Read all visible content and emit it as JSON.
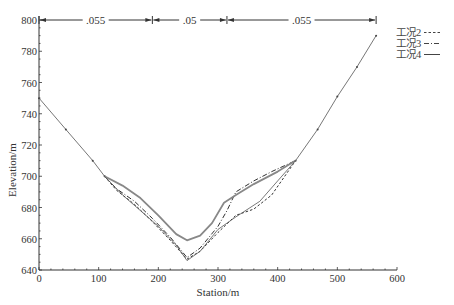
{
  "chart_data": {
    "type": "line",
    "title": "",
    "xlabel": "Station/m",
    "ylabel": "Elevation/m",
    "xlim": [
      0,
      600
    ],
    "ylim": [
      640,
      800
    ],
    "xticks": [
      0,
      100,
      200,
      300,
      400,
      500,
      600
    ],
    "yticks": [
      640,
      660,
      680,
      700,
      720,
      740,
      760,
      780,
      800
    ],
    "grid": false,
    "legend_position": "top-right",
    "roughness_regions": [
      {
        "label": ".055",
        "x_start": 0,
        "x_end": 190
      },
      {
        "label": ".05",
        "x_start": 190,
        "x_end": 315
      },
      {
        "label": ".055",
        "x_start": 315,
        "x_end": 565
      }
    ],
    "ground": {
      "name": "terrain",
      "x": [
        0,
        45,
        90,
        110
      ],
      "y": [
        750,
        730,
        710,
        700
      ],
      "x_right": [
        430,
        467,
        500,
        533,
        565
      ],
      "y_right": [
        710,
        730,
        751,
        770,
        790
      ]
    },
    "series": [
      {
        "name": "工况2",
        "style": "dashed",
        "x": [
          110,
          130,
          160,
          190,
          220,
          248,
          270,
          300,
          330,
          360,
          390,
          430
        ],
        "y": [
          700,
          691,
          682,
          671,
          659,
          647,
          652,
          664,
          675,
          679,
          688,
          710
        ]
      },
      {
        "name": "工况3",
        "style": "dashdot",
        "x": [
          110,
          130,
          160,
          190,
          220,
          248,
          270,
          300,
          315,
          330,
          360,
          390,
          430
        ],
        "y": [
          700,
          692,
          684,
          673,
          661,
          648,
          654,
          668,
          678,
          690,
          697,
          703,
          710
        ]
      },
      {
        "name": "工况4",
        "style": "solid",
        "x": [
          110,
          140,
          170,
          200,
          230,
          248,
          270,
          290,
          310,
          330,
          360,
          400,
          430
        ],
        "y": [
          700,
          694,
          686,
          675,
          663,
          659,
          662,
          670,
          683,
          688,
          695,
          703,
          710
        ]
      },
      {
        "name": "bed",
        "style": "thin",
        "x": [
          110,
          140,
          170,
          200,
          230,
          248,
          270,
          300,
          330,
          370,
          400,
          430
        ],
        "y": [
          700,
          688,
          678,
          668,
          656,
          646,
          652,
          666,
          674,
          684,
          697,
          710
        ]
      }
    ],
    "legend": [
      {
        "label": "工况2",
        "style": "dashed"
      },
      {
        "label": "工况3",
        "style": "dashdot"
      },
      {
        "label": "工况4",
        "style": "solid"
      }
    ],
    "colors": {
      "axis": "#333333",
      "terrain": "#777777",
      "series": "#333333",
      "solid_thick": "#888888"
    }
  }
}
